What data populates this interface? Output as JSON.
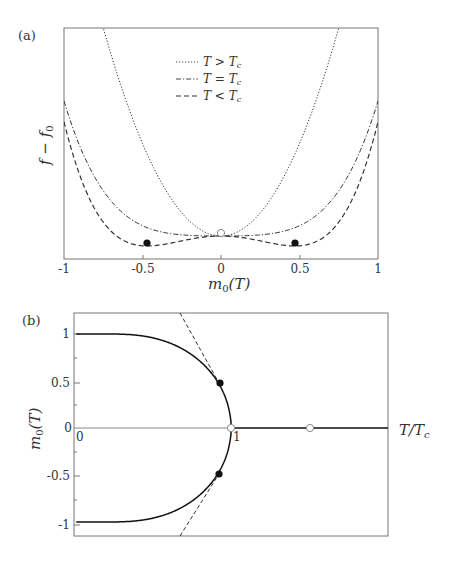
{
  "chart_data": [
    {
      "panel": "(a)",
      "type": "line",
      "title": "",
      "xlabel": "m_0(T)",
      "ylabel": "f − f_0",
      "xlim": [
        -1,
        1
      ],
      "xticks": [
        "-1",
        "-0.5",
        "0",
        "0.5",
        "1"
      ],
      "yticks": [],
      "grid": false,
      "legend_position": "upper-center",
      "series": [
        {
          "name": "T > T_c",
          "style": "dotted",
          "shape": "parabola a·m² , rising steeply, exits top at m≈±0.75"
        },
        {
          "name": "T = T_c",
          "style": "dash-dot",
          "shape": "quartic b·m⁴ , flat at 0, reaches ~0.57 of panel height at m=±1"
        },
        {
          "name": "T < T_c",
          "style": "dashed",
          "shape": "double-well −c·m² + d·m⁴ , minima at m≈±0.47, reaches ~0.35 of panel height at m=±1"
        }
      ],
      "markers": [
        {
          "x": -0.47,
          "kind": "filled",
          "label": "minimum"
        },
        {
          "x": 0.47,
          "kind": "filled",
          "label": "minimum"
        },
        {
          "x": 0,
          "kind": "open",
          "label": "m=0"
        }
      ]
    },
    {
      "panel": "(b)",
      "type": "line",
      "title": "",
      "xlabel": "T/T_c",
      "ylabel": "m_0(T)",
      "xlim": [
        0,
        2.0
      ],
      "ylim": [
        -1.2,
        1.2
      ],
      "xticks": [
        "0",
        "1"
      ],
      "yticks": [
        "1",
        "0.5",
        "0",
        "-0.5",
        "-1"
      ],
      "grid": false,
      "series": [
        {
          "name": "m_0(T) upper branch",
          "style": "solid",
          "x": [
            0,
            0.2,
            0.4,
            0.6,
            0.8,
            0.93,
            1.0
          ],
          "y": [
            1.0,
            1.0,
            0.99,
            0.92,
            0.7,
            0.47,
            0.0
          ]
        },
        {
          "name": "m_0(T) lower branch",
          "style": "solid",
          "x": [
            0,
            0.2,
            0.4,
            0.6,
            0.8,
            0.93,
            1.0
          ],
          "y": [
            -1.0,
            -1.0,
            -0.99,
            -0.92,
            -0.7,
            -0.47,
            0.0
          ]
        },
        {
          "name": "m_0 = 0 (T > T_c)",
          "style": "solid",
          "x": [
            1.0,
            2.0
          ],
          "y": [
            0,
            0
          ]
        },
        {
          "name": "tangent upper",
          "style": "dashed",
          "x": [
            0.71,
            0.93
          ],
          "y": [
            1.2,
            0.47
          ]
        },
        {
          "name": "tangent lower",
          "style": "dashed",
          "x": [
            0.71,
            0.93
          ],
          "y": [
            -1.2,
            -0.47
          ]
        }
      ],
      "markers": [
        {
          "x": 0.93,
          "y": 0.47,
          "kind": "filled"
        },
        {
          "x": 0.93,
          "y": -0.47,
          "kind": "filled"
        },
        {
          "x": 1.0,
          "y": 0,
          "kind": "open"
        },
        {
          "x": 1.5,
          "y": 0,
          "kind": "open"
        }
      ]
    }
  ],
  "panel_a": {
    "tag": "(a)",
    "ylabel": "f − f",
    "ylabel_sub": "0",
    "xlabel_m": "m",
    "xlabel_sub": "0",
    "xlabel_rest": "(T)",
    "xticks": [
      "-1",
      "-0.5",
      "0",
      "0.5",
      "1"
    ],
    "legend": [
      {
        "T": "T",
        "op": ">",
        "Tc": "T",
        "sub": "c"
      },
      {
        "T": "T",
        "op": "=",
        "Tc": "T",
        "sub": "c"
      },
      {
        "T": "T",
        "op": "<",
        "Tc": "T",
        "sub": "c"
      }
    ]
  },
  "panel_b": {
    "tag": "(b)",
    "ylabel_m": "m",
    "ylabel_sub": "0",
    "ylabel_rest": "(T)",
    "xlabel_T": "T/T",
    "xlabel_sub": "c",
    "yticks": [
      "1",
      "0.5",
      "0",
      "-0.5",
      "-1"
    ],
    "xticks": [
      "0",
      "1"
    ]
  }
}
